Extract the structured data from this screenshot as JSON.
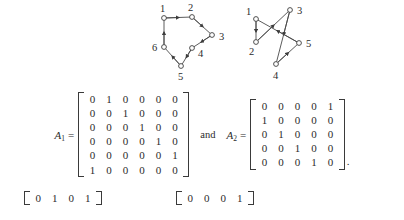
{
  "graphs": [
    {
      "id": "graph-1",
      "node_count": 6,
      "nodes": [
        {
          "id": "1",
          "label": "1",
          "cx": 16,
          "cy": 16,
          "lx": 12,
          "ly": 10
        },
        {
          "id": "2",
          "label": "2",
          "cx": 44,
          "cy": 15,
          "lx": 40,
          "ly": 9
        },
        {
          "id": "3",
          "label": "3",
          "cx": 64,
          "cy": 33,
          "lx": 71,
          "ly": 38
        },
        {
          "id": "4",
          "label": "4",
          "cx": 44,
          "cy": 46,
          "lx": 50,
          "ly": 55
        },
        {
          "id": "5",
          "label": "5",
          "cx": 33,
          "cy": 64,
          "lx": 30,
          "ly": 77
        },
        {
          "id": "6",
          "label": "6",
          "cx": 16,
          "cy": 45,
          "lx": 5,
          "ly": 49
        }
      ],
      "edges": [
        {
          "from": "1",
          "to": "2"
        },
        {
          "from": "2",
          "to": "3"
        },
        {
          "from": "3",
          "to": "4"
        },
        {
          "from": "4",
          "to": "5"
        },
        {
          "from": "5",
          "to": "6"
        },
        {
          "from": "6",
          "to": "1"
        }
      ]
    },
    {
      "id": "graph-2",
      "node_count": 5,
      "nodes": [
        {
          "id": "1",
          "label": "1",
          "cx": 13,
          "cy": 17,
          "lx": 4,
          "ly": 13
        },
        {
          "id": "2",
          "label": "2",
          "cx": 13,
          "cy": 40,
          "lx": 6,
          "ly": 52
        },
        {
          "id": "3",
          "label": "3",
          "cx": 47,
          "cy": 8,
          "lx": 54,
          "ly": 12
        },
        {
          "id": "4",
          "label": "4",
          "cx": 33,
          "cy": 62,
          "lx": 30,
          "ly": 76
        },
        {
          "id": "5",
          "label": "5",
          "cx": 56,
          "cy": 41,
          "lx": 63,
          "ly": 44
        }
      ],
      "edges": [
        {
          "from": "1",
          "to": "2"
        },
        {
          "from": "2",
          "to": "3"
        },
        {
          "from": "3",
          "to": "4"
        },
        {
          "from": "4",
          "to": "5"
        },
        {
          "from": "5",
          "to": "1"
        }
      ]
    }
  ],
  "equation": {
    "matrix_1": {
      "name": "A",
      "subscript": "1",
      "equals": "=",
      "rows": [
        [
          "0",
          "1",
          "0",
          "0",
          "0",
          "0"
        ],
        [
          "0",
          "0",
          "1",
          "0",
          "0",
          "0"
        ],
        [
          "0",
          "0",
          "0",
          "1",
          "0",
          "0"
        ],
        [
          "0",
          "0",
          "0",
          "0",
          "1",
          "0"
        ],
        [
          "0",
          "0",
          "0",
          "0",
          "0",
          "1"
        ],
        [
          "1",
          "0",
          "0",
          "0",
          "0",
          "0"
        ]
      ]
    },
    "conjunction": "and",
    "matrix_2": {
      "name": "A",
      "subscript": "2",
      "equals": "=",
      "rows": [
        [
          "0",
          "0",
          "0",
          "0",
          "1"
        ],
        [
          "1",
          "0",
          "0",
          "0",
          "0"
        ],
        [
          "0",
          "1",
          "0",
          "0",
          "0"
        ],
        [
          "0",
          "0",
          "1",
          "0",
          "0"
        ],
        [
          "0",
          "0",
          "0",
          "1",
          "0"
        ]
      ]
    },
    "trailing_punctuation": "."
  },
  "bottom_partial": {
    "vector_1": {
      "rows": [
        [
          "0",
          "1",
          "0",
          "1"
        ]
      ]
    },
    "vector_2": {
      "rows": [
        [
          "0",
          "0",
          "0",
          "1"
        ]
      ]
    }
  },
  "colors": {
    "background": "#ffffff",
    "ink": "#2b2b2b",
    "bracket": "#3a3a3a",
    "graph_stroke": "#4a4a4a"
  }
}
